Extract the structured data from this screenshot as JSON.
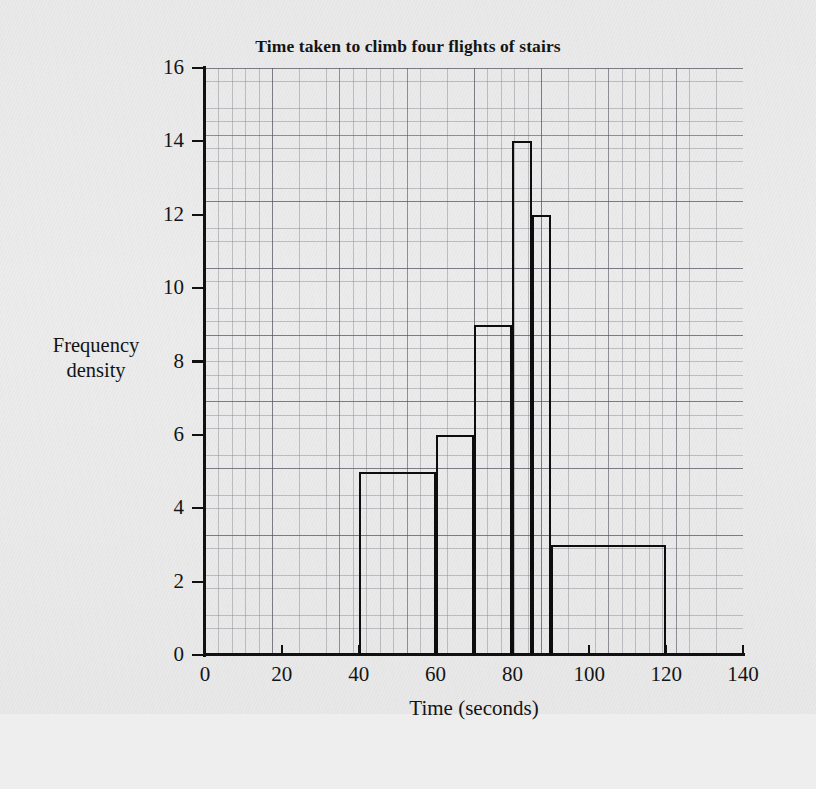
{
  "chart_data": {
    "type": "bar",
    "title": "Time taken to climb four flights of stairs",
    "xlabel": "Time (seconds)",
    "ylabel": "Frequency density",
    "ylabel_line1": "Frequency",
    "ylabel_line2": "density",
    "xlim": [
      0,
      140
    ],
    "ylim": [
      0,
      16
    ],
    "grid": true,
    "legend": null,
    "x_ticks": [
      0,
      20,
      40,
      60,
      80,
      100,
      120,
      140
    ],
    "x_tick_labels": [
      "0",
      "20",
      "40",
      "60",
      "80",
      "100",
      "120",
      "140"
    ],
    "y_ticks": [
      0,
      2,
      4,
      6,
      8,
      10,
      12,
      14,
      16
    ],
    "y_tick_labels": [
      "0",
      "2",
      "4",
      "6",
      "8",
      "10",
      "12",
      "14",
      "16"
    ],
    "bar_style": "histogram-outline",
    "bar_color": "#0d0d0d",
    "bins": [
      {
        "start": 40,
        "end": 60,
        "width": 20,
        "frequency_density": 5,
        "frequency": 100
      },
      {
        "start": 60,
        "end": 70,
        "width": 10,
        "frequency_density": 6,
        "frequency": 60
      },
      {
        "start": 70,
        "end": 80,
        "width": 10,
        "frequency_density": 9,
        "frequency": 90
      },
      {
        "start": 80,
        "end": 85,
        "width": 5,
        "frequency_density": 14,
        "frequency": 70
      },
      {
        "start": 85,
        "end": 90,
        "width": 5,
        "frequency_density": 12,
        "frequency": 60
      },
      {
        "start": 90,
        "end": 120,
        "width": 30,
        "frequency_density": 3,
        "frequency": 90
      }
    ],
    "categories": [
      "40-60",
      "60-70",
      "70-80",
      "80-85",
      "85-90",
      "90-120"
    ],
    "values": [
      5,
      6,
      9,
      14,
      12,
      3
    ]
  },
  "page": {
    "background_color": "#eaeaea",
    "ink_color": "#111111",
    "grid_minor_color": "#8a8a95",
    "grid_major_color": "#5b5b6b"
  }
}
